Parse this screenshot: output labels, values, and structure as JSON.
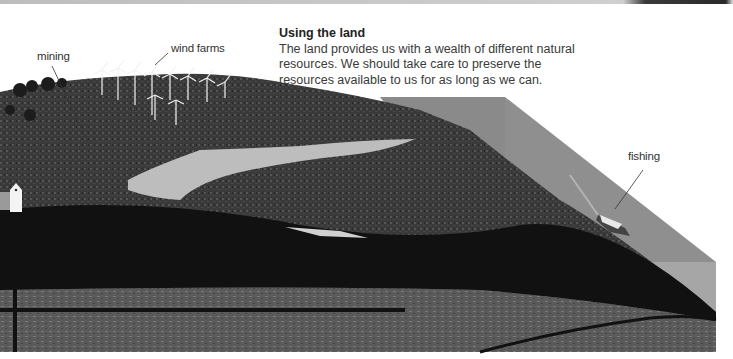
{
  "info_box": {
    "title": "Using the land",
    "body": "The land provides us with a wealth of different natural resources. We should take care to preserve the resources available to us for as long as we can."
  },
  "labels": {
    "mining": "mining",
    "wind_farms": "wind farms",
    "fishing": "fishing"
  },
  "colors": {
    "background": "#ffffff",
    "sea_top": "#8f8f8f",
    "sea_side": "#a6a6a6",
    "land_dark": "#2b2b2b",
    "lake": "#bdbdbd",
    "text": "#3a3a3a"
  }
}
